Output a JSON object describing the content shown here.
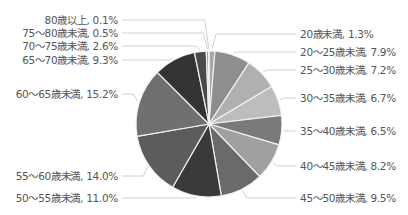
{
  "chart_data": {
    "type": "pie",
    "title": "",
    "unit": "%",
    "start_angle_deg": 0,
    "direction": "clockwise",
    "center": [
      209,
      124
    ],
    "radius": 73,
    "slices": [
      {
        "label": "20歳未満",
        "value": 1.3,
        "text": "20歳未満, 1.3%",
        "color": "#a8a8a8"
      },
      {
        "label": "20～25歳未満",
        "value": 7.9,
        "text": "20～25歳未満, 7.9%",
        "color": "#8e8e8e"
      },
      {
        "label": "25～30歳未満",
        "value": 7.2,
        "text": "25～30歳未満, 7.2%",
        "color": "#b0b0b0"
      },
      {
        "label": "30～35歳未満",
        "value": 6.7,
        "text": "30～35歳未満, 6.7%",
        "color": "#bdbdbd"
      },
      {
        "label": "35～40歳未満",
        "value": 6.5,
        "text": "35～40歳未満, 6.5%",
        "color": "#7a7a7a"
      },
      {
        "label": "40～45歳未満",
        "value": 8.2,
        "text": "40～45歳未満, 8.2%",
        "color": "#a0a0a0"
      },
      {
        "label": "45～50歳未満",
        "value": 9.5,
        "text": "45～50歳未満, 9.5%",
        "color": "#6a6a6a"
      },
      {
        "label": "50～55歳未満",
        "value": 11.0,
        "text": "50～55歳未満, 11.0%",
        "color": "#3a3a3a"
      },
      {
        "label": "55～60歳未満",
        "value": 14.0,
        "text": "55～60歳未満, 14.0%",
        "color": "#5c5c5c"
      },
      {
        "label": "60～65歳未満",
        "value": 15.2,
        "text": "60～65歳未満, 15.2%",
        "color": "#707070"
      },
      {
        "label": "65～70歳未満",
        "value": 9.3,
        "text": "65～70歳未満, 9.3%",
        "color": "#333333"
      },
      {
        "label": "70～75歳未満",
        "value": 2.6,
        "text": "70～75歳未満, 2.6%",
        "color": "#4a4a4a"
      },
      {
        "label": "75～80歳未満",
        "value": 0.5,
        "text": "75～80歳未満, 0.5%",
        "color": "#9a9a9a"
      },
      {
        "label": "80歳以上",
        "value": 0.1,
        "text": "80歳以上, 0.1%",
        "color": "#c8c8c8"
      }
    ],
    "labels_layout": [
      {
        "x": 300,
        "y": 38,
        "anchor": "start"
      },
      {
        "x": 300,
        "y": 56,
        "anchor": "start"
      },
      {
        "x": 300,
        "y": 74,
        "anchor": "start"
      },
      {
        "x": 300,
        "y": 102,
        "anchor": "start"
      },
      {
        "x": 300,
        "y": 135,
        "anchor": "start"
      },
      {
        "x": 300,
        "y": 170,
        "anchor": "start"
      },
      {
        "x": 300,
        "y": 202,
        "anchor": "start"
      },
      {
        "x": 118,
        "y": 202,
        "anchor": "end"
      },
      {
        "x": 118,
        "y": 180,
        "anchor": "end"
      },
      {
        "x": 118,
        "y": 98,
        "anchor": "end"
      },
      {
        "x": 118,
        "y": 64,
        "anchor": "end"
      },
      {
        "x": 118,
        "y": 50,
        "anchor": "end"
      },
      {
        "x": 118,
        "y": 37,
        "anchor": "end"
      },
      {
        "x": 118,
        "y": 24,
        "anchor": "end"
      }
    ],
    "legend": "none (data labels with leader lines)"
  }
}
